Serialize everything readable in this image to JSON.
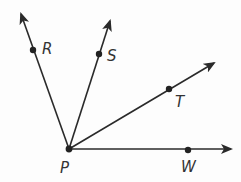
{
  "diagram": {
    "type": "rays-from-common-vertex",
    "vertex": {
      "label": "P",
      "x": 69,
      "y": 149,
      "label_x": 60,
      "label_y": 161
    },
    "rays": [
      {
        "name": "PR",
        "point_label": "R",
        "point": [
          33,
          50
        ],
        "tip": [
          21,
          14
        ],
        "label_x": 42,
        "label_y": 42
      },
      {
        "name": "PS",
        "point_label": "S",
        "point": [
          99,
          54
        ],
        "tip": [
          110,
          21
        ],
        "label_x": 107,
        "label_y": 49
      },
      {
        "name": "PT",
        "point_label": "T",
        "point": [
          169,
          89
        ],
        "tip": [
          214,
          63
        ],
        "label_x": 175,
        "label_y": 95
      },
      {
        "name": "PW",
        "point_label": "W",
        "point": [
          188,
          150
        ],
        "tip": [
          231,
          149
        ],
        "label_x": 181,
        "label_y": 160
      }
    ],
    "colors": {
      "line": "#2a2a2a",
      "point": "#222222",
      "label": "#333333",
      "background": "#fdfdfd"
    }
  }
}
